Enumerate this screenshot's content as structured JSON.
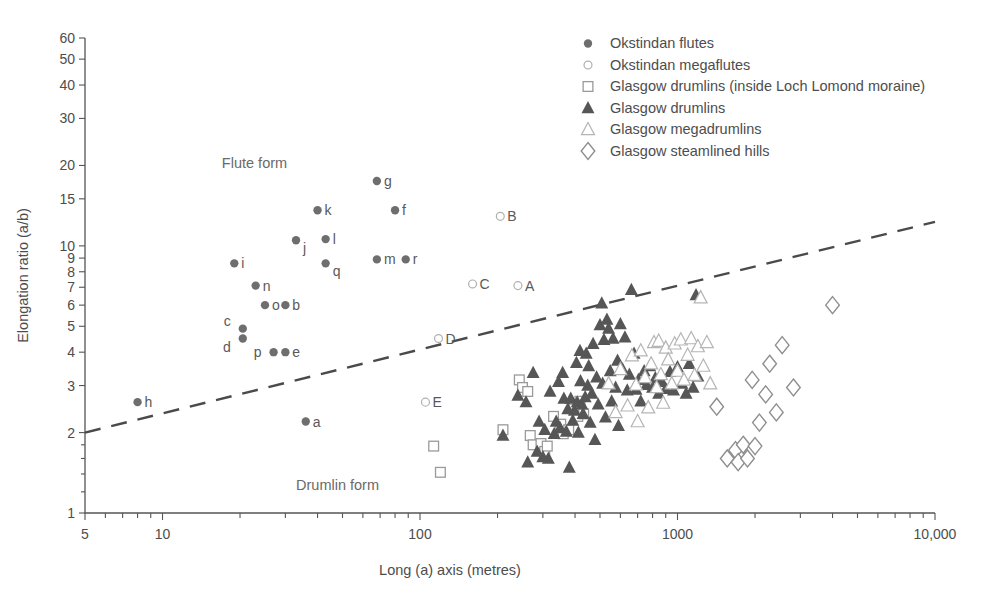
{
  "chart_data": {
    "type": "scatter",
    "title": "",
    "xlabel": "Long (a) axis (metres)",
    "ylabel": "Elongation ratio (a/b)",
    "xscale": "log",
    "yscale": "log",
    "xlim": [
      5,
      10000
    ],
    "ylim": [
      1,
      60
    ],
    "grid": false,
    "xticks": [
      5,
      10,
      100,
      1000,
      10000
    ],
    "xtick_labels": [
      "5",
      "10",
      "100",
      "1000",
      "10,000"
    ],
    "yticks": [
      1,
      2,
      3,
      4,
      5,
      6,
      7,
      8,
      9,
      10,
      15,
      20,
      30,
      40,
      50,
      60
    ],
    "ytick_labels": [
      "1",
      "2",
      "3",
      "4",
      "5",
      "6",
      "7",
      "8",
      "9",
      "10",
      "15",
      "20",
      "30",
      "40",
      "50",
      "60"
    ],
    "legend_position": "top-right",
    "annotations": [
      {
        "text": "Flute form",
        "x": 17,
        "y": 19.5
      },
      {
        "text": "Drumlin form",
        "x": 33,
        "y": 1.22
      }
    ],
    "trendline": {
      "style": "dashed",
      "color": "#4a4a4a",
      "x": [
        5,
        10000
      ],
      "y": [
        2.0,
        12.3
      ],
      "note": "separates flute form (above) from drumlin form (below)"
    },
    "series": [
      {
        "name": "Okstindan flutes",
        "marker": "filled-circle",
        "color": "#6e6e6e",
        "points": [
          {
            "label": "h",
            "x": 8.0,
            "y": 2.6
          },
          {
            "label": "i",
            "x": 19,
            "y": 8.6
          },
          {
            "label": "c",
            "x": 20.5,
            "y": 4.9
          },
          {
            "label": "d",
            "x": 20.5,
            "y": 4.5
          },
          {
            "label": "n",
            "x": 23,
            "y": 7.1
          },
          {
            "label": "o",
            "x": 25,
            "y": 6.0
          },
          {
            "label": "p",
            "x": 27,
            "y": 4.0
          },
          {
            "label": "e",
            "x": 30,
            "y": 4.0
          },
          {
            "label": "b",
            "x": 30,
            "y": 6.0
          },
          {
            "label": "j",
            "x": 33,
            "y": 10.5
          },
          {
            "label": "a",
            "x": 36,
            "y": 2.2
          },
          {
            "label": "k",
            "x": 40,
            "y": 13.6
          },
          {
            "label": "l",
            "x": 43,
            "y": 10.6
          },
          {
            "label": "q",
            "x": 43,
            "y": 8.6
          },
          {
            "label": "g",
            "x": 68,
            "y": 17.5
          },
          {
            "label": "m",
            "x": 68,
            "y": 8.9
          },
          {
            "label": "f",
            "x": 80,
            "y": 13.6
          },
          {
            "label": "r",
            "x": 88,
            "y": 8.9
          }
        ]
      },
      {
        "name": "Okstindan megaflutes",
        "marker": "open-circle",
        "color": "#b0b0b0",
        "points": [
          {
            "label": "E",
            "x": 105,
            "y": 2.6
          },
          {
            "label": "D",
            "x": 118,
            "y": 4.5
          },
          {
            "label": "C",
            "x": 160,
            "y": 7.2
          },
          {
            "label": "B",
            "x": 205,
            "y": 12.9
          },
          {
            "label": "A",
            "x": 240,
            "y": 7.1
          }
        ]
      },
      {
        "name": "Glasgow drumlins (inside Loch Lomond moraine)",
        "marker": "open-square",
        "color": "#9a9a9a",
        "points": [
          {
            "x": 113,
            "y": 1.78
          },
          {
            "x": 120,
            "y": 1.42
          },
          {
            "x": 210,
            "y": 2.05
          },
          {
            "x": 243,
            "y": 3.15
          },
          {
            "x": 250,
            "y": 2.95
          },
          {
            "x": 262,
            "y": 2.85
          },
          {
            "x": 268,
            "y": 1.95
          },
          {
            "x": 275,
            "y": 1.8
          },
          {
            "x": 295,
            "y": 1.82
          },
          {
            "x": 305,
            "y": 1.7
          },
          {
            "x": 312,
            "y": 1.78
          },
          {
            "x": 330,
            "y": 2.3
          },
          {
            "x": 352,
            "y": 2.15
          },
          {
            "x": 360,
            "y": 1.98
          },
          {
            "x": 378,
            "y": 2.05
          },
          {
            "x": 395,
            "y": 2.45
          },
          {
            "x": 410,
            "y": 2.3
          },
          {
            "x": 418,
            "y": 2.62
          },
          {
            "x": 432,
            "y": 2.35
          }
        ]
      },
      {
        "name": "Glasgow drumlins",
        "marker": "filled-triangle",
        "color": "#565656",
        "points": [
          {
            "x": 210,
            "y": 1.95
          },
          {
            "x": 240,
            "y": 2.75
          },
          {
            "x": 258,
            "y": 2.6
          },
          {
            "x": 262,
            "y": 1.55
          },
          {
            "x": 275,
            "y": 3.35
          },
          {
            "x": 285,
            "y": 1.7
          },
          {
            "x": 290,
            "y": 2.2
          },
          {
            "x": 300,
            "y": 1.62
          },
          {
            "x": 305,
            "y": 2.05
          },
          {
            "x": 315,
            "y": 1.6
          },
          {
            "x": 320,
            "y": 2.85
          },
          {
            "x": 332,
            "y": 1.98
          },
          {
            "x": 338,
            "y": 2.2
          },
          {
            "x": 345,
            "y": 3.1
          },
          {
            "x": 350,
            "y": 2.08
          },
          {
            "x": 358,
            "y": 3.35
          },
          {
            "x": 362,
            "y": 2.68
          },
          {
            "x": 370,
            "y": 2.02
          },
          {
            "x": 375,
            "y": 2.45
          },
          {
            "x": 380,
            "y": 1.48
          },
          {
            "x": 385,
            "y": 2.68
          },
          {
            "x": 392,
            "y": 2.22
          },
          {
            "x": 398,
            "y": 2.42
          },
          {
            "x": 405,
            "y": 3.65
          },
          {
            "x": 408,
            "y": 2.6
          },
          {
            "x": 412,
            "y": 2.0
          },
          {
            "x": 418,
            "y": 4.05
          },
          {
            "x": 420,
            "y": 3.12
          },
          {
            "x": 425,
            "y": 2.55
          },
          {
            "x": 430,
            "y": 2.35
          },
          {
            "x": 438,
            "y": 2.72
          },
          {
            "x": 442,
            "y": 3.95
          },
          {
            "x": 448,
            "y": 3.0
          },
          {
            "x": 452,
            "y": 3.55
          },
          {
            "x": 458,
            "y": 2.18
          },
          {
            "x": 465,
            "y": 2.8
          },
          {
            "x": 470,
            "y": 4.3
          },
          {
            "x": 478,
            "y": 1.88
          },
          {
            "x": 485,
            "y": 3.22
          },
          {
            "x": 492,
            "y": 2.55
          },
          {
            "x": 500,
            "y": 5.05
          },
          {
            "x": 508,
            "y": 6.1
          },
          {
            "x": 512,
            "y": 3.05
          },
          {
            "x": 518,
            "y": 4.45
          },
          {
            "x": 525,
            "y": 2.28
          },
          {
            "x": 532,
            "y": 5.3
          },
          {
            "x": 540,
            "y": 4.9
          },
          {
            "x": 548,
            "y": 3.4
          },
          {
            "x": 555,
            "y": 2.62
          },
          {
            "x": 562,
            "y": 4.5
          },
          {
            "x": 575,
            "y": 2.95
          },
          {
            "x": 585,
            "y": 3.72
          },
          {
            "x": 590,
            "y": 2.12
          },
          {
            "x": 600,
            "y": 5.1
          },
          {
            "x": 612,
            "y": 3.45
          },
          {
            "x": 625,
            "y": 4.55
          },
          {
            "x": 638,
            "y": 2.88
          },
          {
            "x": 650,
            "y": 3.3
          },
          {
            "x": 662,
            "y": 6.85
          },
          {
            "x": 678,
            "y": 3.95
          },
          {
            "x": 690,
            "y": 2.9
          },
          {
            "x": 705,
            "y": 3.15
          },
          {
            "x": 720,
            "y": 2.62
          },
          {
            "x": 742,
            "y": 3.4
          },
          {
            "x": 758,
            "y": 3.02
          },
          {
            "x": 780,
            "y": 3.55
          },
          {
            "x": 800,
            "y": 2.95
          },
          {
            "x": 820,
            "y": 3.2
          },
          {
            "x": 845,
            "y": 2.8
          },
          {
            "x": 870,
            "y": 3.1
          },
          {
            "x": 900,
            "y": 2.92
          },
          {
            "x": 935,
            "y": 3.38
          },
          {
            "x": 965,
            "y": 2.88
          },
          {
            "x": 1000,
            "y": 3.52
          },
          {
            "x": 1040,
            "y": 3.05
          },
          {
            "x": 1080,
            "y": 2.8
          },
          {
            "x": 1110,
            "y": 3.62
          },
          {
            "x": 1150,
            "y": 2.95
          },
          {
            "x": 1180,
            "y": 6.55
          },
          {
            "x": 1200,
            "y": 3.25
          }
        ]
      },
      {
        "name": "Glasgow megadrumlins",
        "marker": "open-triangle",
        "color": "#b5b5b5",
        "points": [
          {
            "x": 540,
            "y": 3.05
          },
          {
            "x": 575,
            "y": 2.38
          },
          {
            "x": 600,
            "y": 3.45
          },
          {
            "x": 640,
            "y": 2.52
          },
          {
            "x": 665,
            "y": 3.88
          },
          {
            "x": 690,
            "y": 3.02
          },
          {
            "x": 700,
            "y": 2.2
          },
          {
            "x": 720,
            "y": 4.05
          },
          {
            "x": 748,
            "y": 3.22
          },
          {
            "x": 770,
            "y": 2.48
          },
          {
            "x": 790,
            "y": 3.62
          },
          {
            "x": 810,
            "y": 4.35
          },
          {
            "x": 830,
            "y": 2.95
          },
          {
            "x": 845,
            "y": 4.4
          },
          {
            "x": 862,
            "y": 3.3
          },
          {
            "x": 880,
            "y": 2.58
          },
          {
            "x": 900,
            "y": 4.15
          },
          {
            "x": 920,
            "y": 3.75
          },
          {
            "x": 950,
            "y": 3.05
          },
          {
            "x": 975,
            "y": 4.3
          },
          {
            "x": 1000,
            "y": 3.4
          },
          {
            "x": 1030,
            "y": 4.45
          },
          {
            "x": 1060,
            "y": 3.15
          },
          {
            "x": 1095,
            "y": 3.9
          },
          {
            "x": 1130,
            "y": 4.5
          },
          {
            "x": 1165,
            "y": 3.28
          },
          {
            "x": 1200,
            "y": 4.2
          },
          {
            "x": 1230,
            "y": 6.4
          },
          {
            "x": 1260,
            "y": 3.55
          },
          {
            "x": 1300,
            "y": 4.35
          },
          {
            "x": 1340,
            "y": 3.05
          }
        ]
      },
      {
        "name": "Glasgow steamlined hills",
        "marker": "open-diamond",
        "color": "#8e8e8e",
        "points": [
          {
            "x": 1420,
            "y": 2.5
          },
          {
            "x": 1560,
            "y": 1.6
          },
          {
            "x": 1680,
            "y": 1.72
          },
          {
            "x": 1720,
            "y": 1.55
          },
          {
            "x": 1800,
            "y": 1.8
          },
          {
            "x": 1870,
            "y": 1.6
          },
          {
            "x": 1950,
            "y": 3.15
          },
          {
            "x": 2000,
            "y": 1.78
          },
          {
            "x": 2080,
            "y": 2.18
          },
          {
            "x": 2200,
            "y": 2.78
          },
          {
            "x": 2280,
            "y": 3.62
          },
          {
            "x": 2420,
            "y": 2.38
          },
          {
            "x": 2550,
            "y": 4.25
          },
          {
            "x": 2820,
            "y": 2.95
          },
          {
            "x": 4000,
            "y": 6.0
          }
        ]
      }
    ]
  },
  "legend": {
    "items": [
      {
        "label": "Okstindan flutes",
        "marker": "filled-circle",
        "color": "#6e6e6e"
      },
      {
        "label": "Okstindan megaflutes",
        "marker": "open-circle",
        "color": "#b0b0b0"
      },
      {
        "label": "Glasgow drumlins (inside Loch Lomond moraine)",
        "marker": "open-square",
        "color": "#9a9a9a"
      },
      {
        "label": "Glasgow drumlins",
        "marker": "filled-triangle",
        "color": "#565656"
      },
      {
        "label": "Glasgow megadrumlins",
        "marker": "open-triangle",
        "color": "#b5b5b5"
      },
      {
        "label": "Glasgow steamlined hills",
        "marker": "open-diamond",
        "color": "#8e8e8e"
      }
    ]
  }
}
